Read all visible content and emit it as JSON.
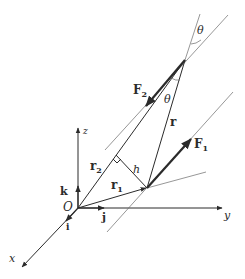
{
  "figure": {
    "colors": {
      "ink": "#2b2b2b",
      "thin_line": "#6a6a6a",
      "background": "#ffffff"
    }
  },
  "axes": {
    "x": "x",
    "y": "y",
    "z": "z",
    "origin": "O",
    "unit_i": "i",
    "unit_j": "j",
    "unit_k": "k"
  },
  "vectors": {
    "r1": {
      "label": "r",
      "sub": "1"
    },
    "r2": {
      "label": "r",
      "sub": "2"
    },
    "r": {
      "label": "r"
    },
    "F1": {
      "label": "F",
      "sub": "1"
    },
    "F2": {
      "label": "F",
      "sub": "2"
    }
  },
  "annotations": {
    "h": "h",
    "theta_top": "θ",
    "theta_mid": "θ"
  }
}
